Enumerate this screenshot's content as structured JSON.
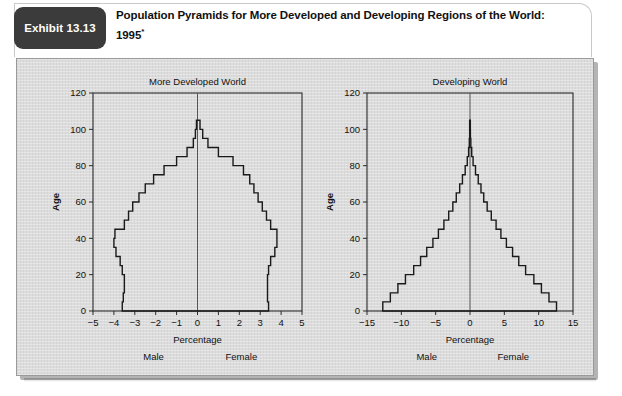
{
  "exhibit": {
    "tab_label": "Exhibit 13.13",
    "title_line1": "Population Pyramids for More Developed and Developing Regions of the World:",
    "title_line2": "1995",
    "title_footnote_marker": "*"
  },
  "colors": {
    "tab_background": "#3b3b3b",
    "tab_text": "#ffffff",
    "panel_background": "#dcdcdc",
    "panel_border": "#9a9a9a",
    "plot_line": "#1a1a1a",
    "axis": "#2b2b2b",
    "header_background": "#ffffff"
  },
  "chart_data": [
    {
      "id": "more-developed-world",
      "type": "bar",
      "orientation": "horizontal-pyramid",
      "title": "More Developed World",
      "xlabel": "Percentage",
      "ylabel": "Age",
      "xlim": [
        -5,
        5
      ],
      "ylim": [
        0,
        120
      ],
      "xticks": [
        -5,
        -4,
        -3,
        -2,
        -1,
        0,
        1,
        2,
        3,
        4,
        5
      ],
      "xticklabels": [
        "−5",
        "−4",
        "−3",
        "−2",
        "−1",
        "0",
        "1",
        "2",
        "3",
        "4",
        "5"
      ],
      "yticks": [
        0,
        20,
        40,
        60,
        80,
        100,
        120
      ],
      "yticklabels": [
        "0",
        "20",
        "40",
        "60",
        "80",
        "100",
        "120"
      ],
      "grid": false,
      "legend": false,
      "side_labels": {
        "left": "Male",
        "right": "Female"
      },
      "age_groups": [
        0,
        5,
        10,
        15,
        20,
        25,
        30,
        35,
        40,
        45,
        50,
        55,
        60,
        65,
        70,
        75,
        80,
        85,
        90,
        95,
        100
      ],
      "age_group_width": 5,
      "series": [
        {
          "name": "Male",
          "side": "left",
          "values": [
            3.6,
            3.55,
            3.5,
            3.5,
            3.6,
            3.7,
            3.9,
            4.0,
            3.95,
            3.5,
            3.3,
            3.1,
            2.8,
            2.5,
            2.1,
            1.6,
            1.0,
            0.5,
            0.2,
            0.1,
            0.05
          ]
        },
        {
          "name": "Female",
          "side": "right",
          "values": [
            3.4,
            3.35,
            3.35,
            3.35,
            3.4,
            3.5,
            3.7,
            3.8,
            3.8,
            3.5,
            3.3,
            3.1,
            2.9,
            2.7,
            2.5,
            2.2,
            1.7,
            1.0,
            0.5,
            0.25,
            0.12
          ]
        }
      ]
    },
    {
      "id": "developing-world",
      "type": "bar",
      "orientation": "horizontal-pyramid",
      "title": "Developing World",
      "xlabel": "Percentage",
      "ylabel": "Age",
      "xlim": [
        -15,
        15
      ],
      "ylim": [
        0,
        120
      ],
      "xticks": [
        -15,
        -10,
        -5,
        0,
        5,
        10,
        15
      ],
      "xticklabels": [
        "−15",
        "−10",
        "−5",
        "0",
        "5",
        "10",
        "15"
      ],
      "yticks": [
        0,
        20,
        40,
        60,
        80,
        100,
        120
      ],
      "yticklabels": [
        "0",
        "20",
        "40",
        "60",
        "80",
        "100",
        "120"
      ],
      "grid": false,
      "legend": false,
      "side_labels": {
        "left": "Male",
        "right": "Female"
      },
      "age_groups": [
        0,
        5,
        10,
        15,
        20,
        25,
        30,
        35,
        40,
        45,
        50,
        55,
        60,
        65,
        70,
        75,
        80,
        85,
        90,
        95,
        100
      ],
      "age_group_width": 5,
      "series": [
        {
          "name": "Male",
          "side": "left",
          "values": [
            12.7,
            11.6,
            10.5,
            9.4,
            8.2,
            7.2,
            6.3,
            5.4,
            4.6,
            3.8,
            3.1,
            2.5,
            2.0,
            1.5,
            1.1,
            0.7,
            0.4,
            0.2,
            0.1,
            0.05,
            0.05
          ]
        },
        {
          "name": "Female",
          "side": "right",
          "values": [
            12.6,
            11.5,
            10.4,
            9.3,
            8.1,
            7.1,
            6.2,
            5.3,
            4.5,
            3.8,
            3.1,
            2.5,
            2.0,
            1.6,
            1.2,
            0.8,
            0.45,
            0.25,
            0.12,
            0.06,
            0.05
          ]
        }
      ]
    }
  ]
}
